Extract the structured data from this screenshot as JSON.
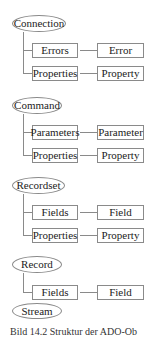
{
  "diagram": {
    "groups": [
      {
        "root": "Connection",
        "children": [
          {
            "collection": "Errors",
            "object": "Error"
          },
          {
            "collection": "Properties",
            "object": "Property"
          }
        ]
      },
      {
        "root": "Command",
        "children": [
          {
            "collection": "Parameters",
            "object": "Parameter"
          },
          {
            "collection": "Properties",
            "object": "Property"
          }
        ]
      },
      {
        "root": "Recordset",
        "children": [
          {
            "collection": "Fields",
            "object": "Field"
          },
          {
            "collection": "Properties",
            "object": "Property"
          }
        ]
      },
      {
        "root": "Record",
        "children": [
          {
            "collection": "Fields",
            "object": "Field"
          }
        ]
      },
      {
        "root": "Stream",
        "children": []
      }
    ],
    "caption": "Bild 14.2 Struktur der ADO-Ob"
  }
}
